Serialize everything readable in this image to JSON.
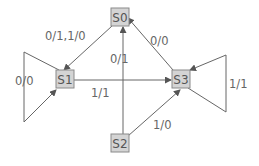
{
  "diagram": {
    "type": "state-transition",
    "colors": {
      "node_fill": "#d4d4d4",
      "node_border": "#8a8a8a",
      "edge": "#666666",
      "text": "#555555"
    },
    "nodes": [
      {
        "id": "S0",
        "label": "S0"
      },
      {
        "id": "S1",
        "label": "S1"
      },
      {
        "id": "S2",
        "label": "S2"
      },
      {
        "id": "S3",
        "label": "S3"
      }
    ],
    "edges": [
      {
        "from": "S0",
        "to": "S1",
        "label": "0/1,1/0"
      },
      {
        "from": "S1",
        "to": "S1",
        "label": "0/0"
      },
      {
        "from": "S1",
        "to": "S3",
        "label": "1/1"
      },
      {
        "from": "S2",
        "to": "S0",
        "label": "0/1"
      },
      {
        "from": "S2",
        "to": "S3",
        "label": "1/0"
      },
      {
        "from": "S3",
        "to": "S0",
        "label": "0/0"
      },
      {
        "from": "S3",
        "to": "S3",
        "label": "1/1"
      }
    ]
  }
}
